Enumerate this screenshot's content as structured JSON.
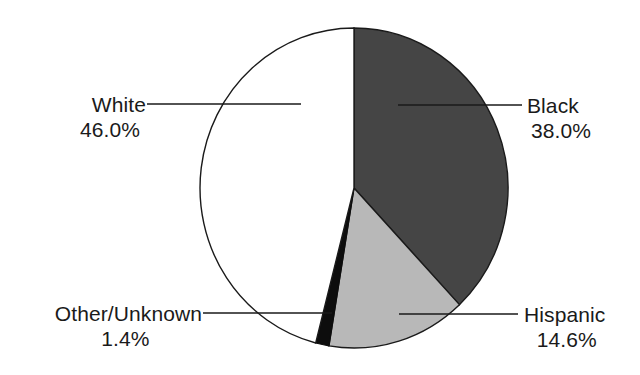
{
  "chart_data": {
    "type": "pie",
    "title": "",
    "subtitle": "",
    "xlabel": "",
    "ylabel": "",
    "legend_position": "callout-labels",
    "grid": false,
    "start_angle_deg": 0,
    "direction": "clockwise",
    "categories": [
      "Black",
      "Hispanic",
      "Other/Unknown",
      "White"
    ],
    "values": [
      38.0,
      14.6,
      1.4,
      46.0
    ],
    "unit": "%",
    "slices": [
      {
        "label": "Black",
        "value": 38.0,
        "value_text": "38.0%",
        "color": "#454545",
        "stroke": "#1a1a1a",
        "start_pct": 0.0,
        "end_pct": 38.0
      },
      {
        "label": "Hispanic",
        "value": 14.6,
        "value_text": "14.6%",
        "color": "#b8b8b8",
        "stroke": "#1a1a1a",
        "start_pct": 38.0,
        "end_pct": 52.6
      },
      {
        "label": "Other/Unknown",
        "value": 1.4,
        "value_text": "1.4%",
        "color": "#0d0d0d",
        "stroke": "#0d0d0d",
        "start_pct": 52.6,
        "end_pct": 54.0
      },
      {
        "label": "White",
        "value": 46.0,
        "value_text": "46.0%",
        "color": "#ffffff",
        "stroke": "#1a1a1a",
        "start_pct": 54.0,
        "end_pct": 100.0
      }
    ]
  },
  "labels": {
    "white": {
      "category": "White",
      "percent": "46.0%"
    },
    "black": {
      "category": "Black",
      "percent": "38.0%"
    },
    "other": {
      "category": "Other/Unknown",
      "percent": "1.4%"
    },
    "hispanic": {
      "category": "Hispanic",
      "percent": "14.6%"
    }
  },
  "colors": {
    "background": "#ffffff",
    "text": "#1a1a1a",
    "outline": "#1a1a1a",
    "leader_line": "#1a1a1a",
    "slice_black": "#454545",
    "slice_hispanic": "#b8b8b8",
    "slice_other": "#0d0d0d",
    "slice_white": "#ffffff"
  }
}
